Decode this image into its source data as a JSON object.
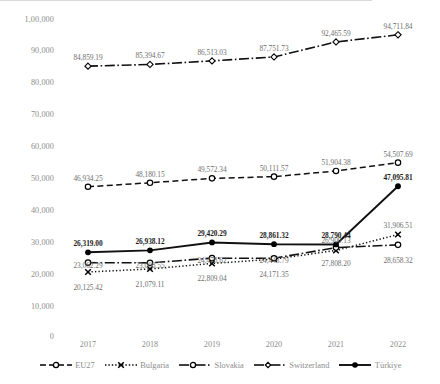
{
  "chart_data": {
    "type": "line",
    "title": "",
    "xlabel": "",
    "ylabel": "",
    "categories": [
      "2017",
      "2018",
      "2019",
      "2020",
      "2021",
      "2022"
    ],
    "ylim": [
      0,
      100000
    ],
    "yticks": [
      0,
      10000,
      20000,
      30000,
      40000,
      50000,
      60000,
      70000,
      80000,
      90000,
      100000
    ],
    "ytick_labels": [
      "0",
      "10,000",
      "20,000",
      "30,000",
      "40,000",
      "50,000",
      "60,000",
      "70,000",
      "80,000",
      "90,000",
      "1,00,000"
    ],
    "grid": false,
    "legend_position": "bottom",
    "series": [
      {
        "name": "EU27",
        "marker": "circle-open",
        "line_style": "dashed",
        "values": [
          46934.25,
          48180.15,
          49572.34,
          50111.57,
          51904.38,
          54507.69
        ],
        "labels": [
          "46,934.25",
          "48,180.15",
          "49,572.34",
          "50,111.57",
          "51,904.38",
          "54,507.69"
        ]
      },
      {
        "name": "Bulgaria",
        "marker": "x-cross",
        "line_style": "dotted",
        "values": [
          20125.42,
          21079.11,
          22809.04,
          24171.35,
          26900.13,
          31906.51
        ],
        "labels": [
          "20,125.42",
          "21,079.11",
          "22,809.04",
          "24,171.35",
          "26,900.13",
          "31,906.51"
        ]
      },
      {
        "name": "Slovakia",
        "marker": "circle-open",
        "line_style": "dash-dot",
        "values": [
          23062.29,
          23008.55,
          24478.62,
          24443.79,
          27808.2,
          28658.32
        ],
        "labels": [
          "23,062.29",
          "23,008.55",
          "24,478.62",
          "24,443.79",
          "27,808.20",
          "28,658.32"
        ]
      },
      {
        "name": "Switzerland",
        "marker": "diamond-open",
        "line_style": "dash-dot",
        "values": [
          84859.19,
          85394.67,
          86513.03,
          87751.73,
          92465.59,
          94711.84
        ],
        "labels": [
          "84,859.19",
          "85,394.67",
          "86,513.03",
          "87,751.73",
          "92,465.59",
          "94,711.84"
        ]
      },
      {
        "name": "Türkiye",
        "marker": "circle-filled",
        "line_style": "solid",
        "values": [
          26319.0,
          26938.12,
          29420.29,
          28861.32,
          28790.44,
          47095.81
        ],
        "labels": [
          "26,319.00",
          "26,938.12",
          "29,420.29",
          "28,861.32",
          "28,790.44",
          "47,095.81"
        ]
      }
    ]
  },
  "yaxis": {
    "t10": "1,00,000",
    "t9": "90,000",
    "t8": "80,000",
    "t7": "70,000",
    "t6": "60,000",
    "t5": "50,000",
    "t4": "40,000",
    "t3": "30,000",
    "t2": "20,000",
    "t1": "10,000",
    "t0": "0"
  },
  "xaxis": {
    "y2017": "2017",
    "y2018": "2018",
    "y2019": "2019",
    "y2020": "2020",
    "y2021": "2021",
    "y2022": "2022"
  },
  "legend": {
    "eu27": "EU27",
    "bulgaria": "Bulgaria",
    "slovakia": "Slovakia",
    "switzerland": "Switzerland",
    "turkiye": "Türkiye"
  },
  "colors": {
    "series": "#000000",
    "axis": "#d9d9d9",
    "tick_text": "#8d8d8d",
    "label_text": "#6f6f6f",
    "label_emphasis": "#1c1c1c"
  }
}
